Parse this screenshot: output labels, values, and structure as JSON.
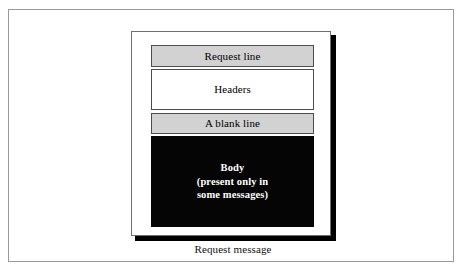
{
  "figure": {
    "caption": "Request message",
    "sections": [
      {
        "id": "request-line",
        "label": "Request  line",
        "style": "shaded",
        "fill": "#d2d2d2",
        "text_color": "#000000"
      },
      {
        "id": "headers",
        "label": "Headers",
        "style": "plain",
        "fill": "#ffffff",
        "text_color": "#000000"
      },
      {
        "id": "blank-line",
        "label": "A blank line",
        "style": "shaded",
        "fill": "#d2d2d2",
        "text_color": "#000000"
      },
      {
        "id": "body",
        "label": "Body\n(present only in\nsome messages)",
        "style": "filled",
        "fill": "#050505",
        "text_color": "#ffffff"
      }
    ]
  },
  "colors": {
    "page_background": "#ffffff",
    "outer_frame_border": "#9a9a9a",
    "card_border": "#6f6f6f",
    "card_shadow": "#000000",
    "box_border": "#4d4d4d",
    "shaded_fill": "#d2d2d2",
    "filled_fill": "#050505"
  }
}
